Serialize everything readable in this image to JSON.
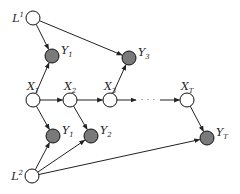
{
  "diagram": {
    "type": "graphical-model",
    "colors": {
      "observed_fill": "#7a7a7a",
      "latent_fill": "#ffffff",
      "stroke": "#111111",
      "edge": "#222222"
    },
    "nodes": [
      {
        "id": "L1",
        "base": "L",
        "sup": "1",
        "sub": "",
        "x": 33,
        "y": 18,
        "observed": false,
        "label_side": "left"
      },
      {
        "id": "Y1a",
        "base": "Y",
        "sup": "",
        "sub": "1",
        "x": 52,
        "y": 56,
        "observed": true,
        "label_side": "right"
      },
      {
        "id": "Y3",
        "base": "Y",
        "sup": "",
        "sub": "3",
        "x": 129,
        "y": 58,
        "observed": true,
        "label_side": "right"
      },
      {
        "id": "X1",
        "base": "X",
        "sup": "",
        "sub": "1",
        "x": 33,
        "y": 100,
        "observed": false,
        "label_side": "top"
      },
      {
        "id": "X2",
        "base": "X",
        "sup": "",
        "sub": "2",
        "x": 70,
        "y": 100,
        "observed": false,
        "label_side": "top"
      },
      {
        "id": "X3",
        "base": "X",
        "sup": "",
        "sub": "3",
        "x": 110,
        "y": 100,
        "observed": false,
        "label_side": "top"
      },
      {
        "id": "XT",
        "base": "X",
        "sup": "",
        "sub": "T",
        "x": 187,
        "y": 100,
        "observed": false,
        "label_side": "top"
      },
      {
        "id": "Y1b",
        "base": "Y",
        "sup": "",
        "sub": "1",
        "x": 53,
        "y": 136,
        "observed": true,
        "label_side": "right"
      },
      {
        "id": "Y2",
        "base": "Y",
        "sup": "",
        "sub": "2",
        "x": 91,
        "y": 136,
        "observed": true,
        "label_side": "right"
      },
      {
        "id": "YT",
        "base": "Y",
        "sup": "",
        "sub": "T",
        "x": 207,
        "y": 138,
        "observed": true,
        "label_side": "right"
      },
      {
        "id": "L2",
        "base": "L",
        "sup": "2",
        "sub": "",
        "x": 32,
        "y": 176,
        "observed": false,
        "label_side": "left"
      }
    ],
    "edges": [
      [
        "L1",
        "Y1a"
      ],
      [
        "L1",
        "Y3"
      ],
      [
        "X1",
        "Y1a"
      ],
      [
        "X3",
        "Y3"
      ],
      [
        "X1",
        "X2"
      ],
      [
        "X2",
        "X3"
      ],
      [
        "X3",
        "dots"
      ],
      [
        "dots",
        "XT"
      ],
      [
        "X1",
        "Y1b"
      ],
      [
        "X2",
        "Y2"
      ],
      [
        "XT",
        "YT"
      ],
      [
        "L2",
        "Y1b"
      ],
      [
        "L2",
        "Y2"
      ],
      [
        "L2",
        "YT"
      ]
    ],
    "ellipsis": {
      "text": "· · ·",
      "x": 148,
      "y": 100
    }
  }
}
